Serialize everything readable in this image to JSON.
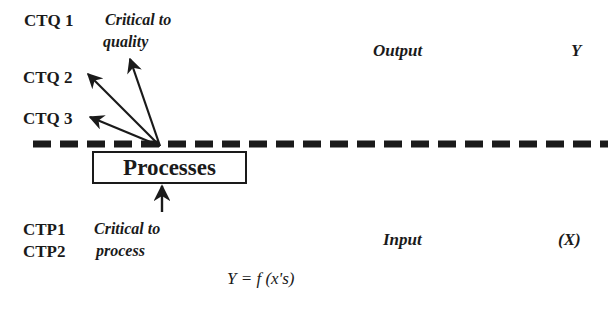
{
  "outputs": {
    "items": [
      {
        "label": "CTQ 1"
      },
      {
        "label": "CTQ 2"
      },
      {
        "label": "CTQ 3"
      }
    ],
    "note_line1": "Critical to",
    "note_line2": "quality",
    "side_label": "Output",
    "variable": "Y"
  },
  "process": {
    "label": "Processes"
  },
  "inputs": {
    "items": [
      {
        "label": "CTP1"
      },
      {
        "label": "CTP2"
      }
    ],
    "note_line1": "Critical to",
    "note_line2": "process",
    "side_label": "Input",
    "variable": "(X)"
  },
  "formula": "Y = f (x's)",
  "colors": {
    "ink": "#1a1a1a",
    "background": "#ffffff"
  }
}
